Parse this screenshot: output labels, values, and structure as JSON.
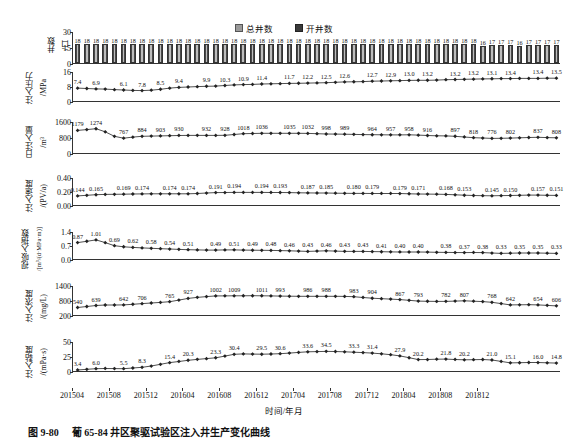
{
  "figure": {
    "caption_number": "图 9-80",
    "caption_text": "葡 65-84 井区聚驱试验区注入井生产变化曲线"
  },
  "legend": {
    "items": [
      {
        "label": "总井数",
        "color": "#9a9a9a",
        "key": "total_wells"
      },
      {
        "label": "开井数",
        "color": "#3a3a3a",
        "key": "open_wells"
      }
    ]
  },
  "axes": {
    "x_title": "时间/年月",
    "x_ticks": [
      "201504",
      "201508",
      "201512",
      "201604",
      "201608",
      "201612",
      "201704",
      "201708",
      "201712",
      "201804",
      "201808",
      "201812"
    ]
  },
  "chart_data": [
    {
      "type": "bar",
      "panel": "wells",
      "title": "",
      "ylabel": "井数",
      "yunit": "/口",
      "ylim": [
        0,
        30
      ],
      "yticks": [
        0,
        15,
        30
      ],
      "ytick_labels": [
        "0",
        "15",
        "30"
      ],
      "series": [
        {
          "name": "总井数",
          "values": [
            18,
            18,
            18,
            18,
            18,
            18,
            18,
            18,
            18,
            18,
            18,
            18,
            18,
            18,
            18,
            18,
            18,
            18,
            18,
            18,
            18,
            18,
            18,
            18,
            18,
            18,
            18,
            18,
            18,
            18,
            18,
            18,
            18,
            18,
            18,
            18,
            18,
            18,
            18,
            18,
            18,
            18,
            18,
            18,
            16,
            17,
            17,
            17,
            16,
            17,
            17,
            17,
            17
          ]
        },
        {
          "name": "开井数",
          "values": [
            18,
            18,
            18,
            18,
            18,
            18,
            18,
            18,
            18,
            18,
            18,
            18,
            18,
            18,
            18,
            18,
            18,
            18,
            18,
            18,
            18,
            18,
            18,
            18,
            18,
            18,
            18,
            18,
            18,
            18,
            18,
            18,
            18,
            18,
            18,
            18,
            18,
            18,
            18,
            18,
            18,
            18,
            18,
            18,
            16,
            17,
            17,
            17,
            16,
            17,
            17,
            17,
            17
          ]
        }
      ],
      "data_labels": [
        "18",
        "18",
        "18",
        "18",
        "18",
        "18",
        "18",
        "18",
        "18",
        "18",
        "18",
        "18",
        "18",
        "18",
        "18",
        "18",
        "18",
        "18",
        "18",
        "18",
        "18",
        "18",
        "18",
        "18",
        "18",
        "18",
        "18",
        "18",
        "18",
        "18",
        "18",
        "18",
        "18",
        "18",
        "18",
        "18",
        "18",
        "18",
        "18",
        "18",
        "18",
        "18",
        "18",
        "18",
        "16",
        "17",
        "17",
        "17",
        "16",
        "17",
        "17",
        "17",
        "17"
      ]
    },
    {
      "type": "line",
      "panel": "pressure",
      "ylabel": "注入压力",
      "yunit": "/MPa",
      "ylim": [
        0,
        16
      ],
      "yticks": [
        0,
        8,
        16
      ],
      "ytick_labels": [
        "0",
        "8",
        "16"
      ],
      "values": [
        7.4,
        7.2,
        7.0,
        6.9,
        6.6,
        6.4,
        6.2,
        6.1,
        6.3,
        6.8,
        7.4,
        7.8,
        8.0,
        8.2,
        8.4,
        8.5,
        8.8,
        9.1,
        9.3,
        9.4,
        9.6,
        9.7,
        9.8,
        9.9,
        10.0,
        10.1,
        10.2,
        10.3,
        10.5,
        10.7,
        10.8,
        10.9,
        11.1,
        11.2,
        11.3,
        11.4,
        11.5,
        11.6,
        11.6,
        11.7,
        11.9,
        12.0,
        12.1,
        12.2,
        12.3,
        12.4,
        12.5,
        12.5,
        12.6,
        12.6,
        12.6,
        12.7,
        12.7,
        12.8,
        12.9,
        12.9,
        13.0,
        13.0,
        13.1,
        13.2,
        13.2,
        13.2,
        13.2,
        13.2,
        13.1,
        13.1,
        13.2,
        13.4,
        13.4,
        13.4,
        13.4,
        13.4,
        13.5
      ],
      "label_indices": [
        0,
        3,
        7,
        11,
        15,
        19,
        23,
        27,
        31,
        35,
        39,
        43,
        47,
        51,
        55,
        59,
        63,
        67,
        71
      ],
      "labels": [
        "7.4",
        "6.9",
        "6.1",
        "7.8",
        "8.5",
        "9.4",
        "9.9",
        "10.3",
        "10.9",
        "11.4",
        "11.7",
        "12.2",
        "12.5",
        "12.6",
        "12.7",
        "12.9",
        "13.0",
        "13.2",
        "13.2",
        "13.2",
        "13.1",
        "13.4",
        "13.4",
        "13.5"
      ],
      "labels_shown": [
        "7.4",
        "6.9",
        "6.1",
        "7.8",
        "8.5",
        "9.4",
        "9.9",
        "10.3",
        "10.9",
        "11.4",
        "11.7",
        "12.2",
        "12.5",
        "12.6",
        "12.7",
        "12.9",
        "13.0",
        "13.2",
        "13.2",
        "13.2",
        "13.1",
        "13.4",
        "13.4",
        "13.5"
      ]
    },
    {
      "type": "line",
      "panel": "daily_injection",
      "ylabel": "日注入量",
      "yunit": "/m³",
      "ylim": [
        0,
        1600
      ],
      "yticks": [
        0,
        800,
        1600
      ],
      "ytick_labels": [
        "0",
        "800",
        "1600"
      ],
      "labels": [
        "1179",
        "1274",
        "767",
        "884",
        "903",
        "930",
        "932",
        "928",
        "1018",
        "1036",
        "1035",
        "1032",
        "998",
        "989",
        "964",
        "957",
        "958",
        "916",
        "897",
        "818",
        "776",
        "802",
        "837",
        "808"
      ]
    },
    {
      "type": "line",
      "panel": "injection_rate",
      "ylabel": "注入速度",
      "yunit": "/(PV/a)",
      "ylim": [
        0.0,
        0.4
      ],
      "yticks": [
        0.0,
        0.2,
        0.4
      ],
      "ytick_labels": [
        "0.00",
        "0.20",
        "0.40"
      ],
      "labels": [
        "0.144",
        "0.165",
        "0.169",
        "0.174",
        "0.174",
        "0.174",
        "0.191",
        "0.194",
        "0.194",
        "0.193",
        "0.187",
        "0.185",
        "0.180",
        "0.179",
        "0.179",
        "0.171",
        "0.168",
        "0.153",
        "0.145",
        "0.150",
        "0.157",
        "0.151"
      ]
    },
    {
      "type": "line",
      "panel": "absorption_index",
      "ylabel": "视吸入指数",
      "yunit": "/[m³/(d·MPa·m)]",
      "ylim": [
        0.0,
        1.4
      ],
      "yticks": [
        0.0,
        0.7,
        1.4
      ],
      "ytick_labels": [
        "0.0",
        "0.7",
        "1.4"
      ],
      "labels": [
        "0.87",
        "1.01",
        "0.69",
        "0.62",
        "0.58",
        "0.54",
        "0.51",
        "0.49",
        "0.51",
        "0.49",
        "0.48",
        "0.46",
        "0.43",
        "0.46",
        "0.43",
        "0.43",
        "0.41",
        "0.40",
        "0.40",
        "0.38",
        "0.37",
        "0.38",
        "0.33",
        "0.35",
        "0.35",
        "0.33"
      ]
    },
    {
      "type": "line",
      "panel": "concentration",
      "ylabel": "注入浓度",
      "yunit": "/(mg/L)",
      "ylim": [
        200,
        1400
      ],
      "yticks": [
        200,
        800,
        1400
      ],
      "ytick_labels": [
        "200",
        "800",
        "1400"
      ],
      "labels": [
        "540",
        "639",
        "642",
        "706",
        "765",
        "927",
        "1002",
        "1009",
        "1011",
        "993",
        "986",
        "988",
        "983",
        "904",
        "867",
        "793",
        "782",
        "807",
        "768",
        "642",
        "654",
        "606"
      ]
    },
    {
      "type": "line",
      "panel": "viscosity",
      "ylabel": "注入黏度",
      "yunit": "/(mPa·s)",
      "ylim": [
        0,
        50
      ],
      "yticks": [
        0,
        25,
        50
      ],
      "ytick_labels": [
        "0",
        "25",
        "50"
      ],
      "labels": [
        "3.4",
        "6.0",
        "5.5",
        "8.3",
        "15.4",
        "20.3",
        "23.3",
        "30.4",
        "29.5",
        "30.6",
        "33.6",
        "34.5",
        "33.3",
        "31.4",
        "27.9",
        "20.2",
        "21.8",
        "20.2",
        "21.0",
        "15.1",
        "16.0",
        "14.8"
      ]
    }
  ]
}
